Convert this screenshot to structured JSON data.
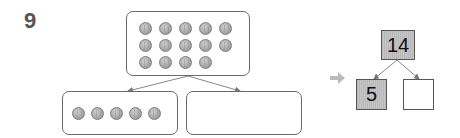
{
  "problem": {
    "number": "9"
  },
  "top_group": {
    "count": 14,
    "rows": [
      5,
      5,
      4
    ]
  },
  "left_group": {
    "count": 5
  },
  "right_group": {
    "count": 0
  },
  "number_bond": {
    "whole": "14",
    "part_known": "5",
    "part_unknown": ""
  },
  "colors": {
    "coin": "#aaaaaa",
    "box_border": "#6a6a6a",
    "shaded_box": "#bdbdbd",
    "arrow": "#bbbbbb"
  }
}
